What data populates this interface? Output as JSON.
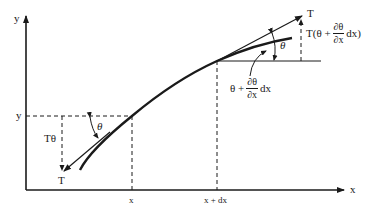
{
  "diagram": {
    "type": "string-tension-element",
    "colors": {
      "ink": "#1a1a1a",
      "background": "#ffffff"
    },
    "axes": {
      "x_label": "x",
      "y_label": "y"
    },
    "ticks": {
      "x_tick_1": "x",
      "x_tick_2": "x + dx",
      "y_tick": "y"
    },
    "left_end": {
      "tension_label": "T",
      "vertical_component_label": "Tθ",
      "angle_label": "θ"
    },
    "right_end": {
      "tension_label": "T",
      "angle_label": "θ",
      "vertical_component": {
        "prefix": "T(θ +",
        "frac_num": "∂θ",
        "frac_den": "∂x",
        "suffix": "dx)"
      },
      "angle_expression": {
        "prefix": "θ +",
        "frac_num": "∂θ",
        "frac_den": "∂x",
        "suffix": "dx"
      }
    }
  }
}
